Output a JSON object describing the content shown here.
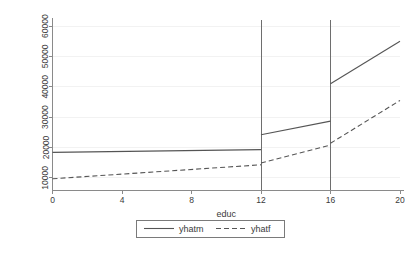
{
  "chart_data": {
    "type": "line",
    "title": "",
    "xlabel": "educ",
    "ylabel": "",
    "xlim": [
      0,
      20
    ],
    "ylim": [
      6000,
      62000
    ],
    "grid": true,
    "legend_position": "bottom-center",
    "x_ticks": [
      "0",
      "4",
      "8",
      "12",
      "16",
      "20"
    ],
    "x_tick_values": [
      0,
      4,
      8,
      12,
      16,
      20
    ],
    "y_ticks": [
      "10000",
      "20000",
      "30000",
      "40000",
      "50000",
      "60000"
    ],
    "y_tick_values": [
      10000,
      20000,
      30000,
      40000,
      50000,
      60000
    ],
    "reference_lines": [
      {
        "x": 12,
        "orientation": "vertical"
      },
      {
        "x": 16,
        "orientation": "vertical"
      }
    ],
    "series": [
      {
        "name": "yhatm",
        "style": "solid",
        "color": "#555555",
        "segments": [
          {
            "x": [
              0,
              12
            ],
            "y": [
              18400,
              19300
            ]
          },
          {
            "x": [
              12,
              16
            ],
            "y": [
              24200,
              28700
            ]
          },
          {
            "x": [
              16,
              20
            ],
            "y": [
              41000,
              55000
            ]
          }
        ]
      },
      {
        "name": "yhatf",
        "style": "dashed",
        "color": "#555555",
        "segments": [
          {
            "x": [
              0,
              12
            ],
            "y": [
              9700,
              14300
            ]
          },
          {
            "x": [
              12,
              16
            ],
            "y": [
              14900,
              20800
            ]
          },
          {
            "x": [
              16,
              20
            ],
            "y": [
              21400,
              35500
            ]
          }
        ]
      }
    ]
  },
  "legend": {
    "entries": [
      {
        "label": "yhatm",
        "style": "solid"
      },
      {
        "label": "yhatf",
        "style": "dashed"
      }
    ]
  }
}
